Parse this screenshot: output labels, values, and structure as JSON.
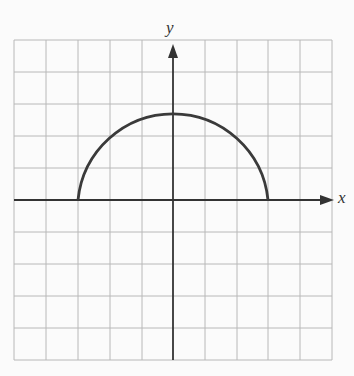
{
  "diagram": {
    "type": "coordinate-graph",
    "x_axis_label": "x",
    "y_axis_label": "y",
    "grid": {
      "columns": 10,
      "rows": 10,
      "x_range": [
        -5,
        5
      ],
      "y_range": [
        -5,
        5
      ]
    },
    "curve": {
      "shape": "upper semicircle",
      "center": [
        0,
        0
      ],
      "radius": 3,
      "equation": "y = sqrt(9 - x^2)"
    },
    "colors": {
      "grid": "#b8b8b8",
      "axes": "#333333",
      "curve": "#3a3a3a",
      "background": "#fbfbfb"
    }
  }
}
